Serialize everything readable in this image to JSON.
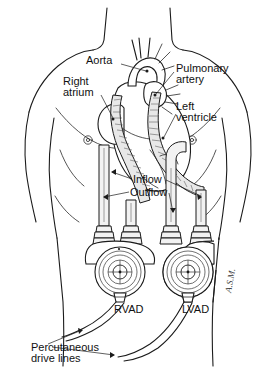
{
  "figure": {
    "line_color": "#1b1b1b",
    "background_color": "#ffffff"
  },
  "labels": {
    "aorta": "Aorta",
    "right_atrium_line1": "Right",
    "right_atrium_line2": "atrium",
    "pulmonary_artery_line1": "Pulmonary",
    "pulmonary_artery_line2": "artery",
    "left_ventricle_line1": "Left",
    "left_ventricle_line2": "ventricle",
    "inflow": "Inflow",
    "outflow": "Outflow",
    "rvad": "RVAD",
    "lvad": "LVAD",
    "percutaneous_line1": "Percutaneous",
    "percutaneous_line2": "drive lines"
  },
  "anatomy": {
    "parts": [
      "torso-outline",
      "neck",
      "shoulders",
      "pectoral-contours",
      "nipple-left",
      "nipple-right",
      "heart",
      "aortic-arch",
      "pulmonary-artery",
      "right-atrium",
      "left-ventricle"
    ]
  },
  "devices": {
    "rvad": {
      "name": "RVAD",
      "position": "patient-right-abdomen",
      "inflow_from": "Right atrium",
      "outflow_to": "Pulmonary artery"
    },
    "lvad": {
      "name": "LVAD",
      "position": "patient-left-abdomen",
      "inflow_from": "Left ventricle",
      "outflow_to": "Aorta"
    },
    "drive_lines": {
      "name": "Percutaneous drive lines",
      "count": 2,
      "exit_site": "lower-left-abdomen"
    },
    "cannulae": {
      "count": 4,
      "types": [
        "Inflow",
        "Outflow"
      ]
    }
  },
  "signature": {
    "artist_mark": "A.S.M."
  }
}
